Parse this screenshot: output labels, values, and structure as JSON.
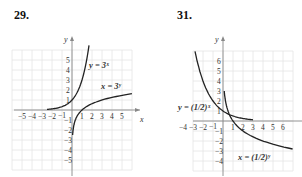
{
  "problems": [
    {
      "number": "29.",
      "x_axis_label": "x",
      "y_axis_label": "y",
      "x_ticks": [
        "-5",
        "-4",
        "-3",
        "-2",
        "-1",
        "1",
        "2",
        "3",
        "4",
        "5"
      ],
      "y_ticks": [
        "5",
        "4",
        "3",
        "2",
        "1",
        "-1",
        "-2",
        "-3",
        "-4",
        "-5"
      ],
      "curve_labels": [
        "y = 3ˣ",
        "x = 3ʸ"
      ]
    },
    {
      "number": "31.",
      "x_axis_label": "x",
      "y_axis_label": "y",
      "x_ticks": [
        "-4",
        "-3",
        "-2",
        "-1",
        "1",
        "2",
        "3",
        "4",
        "5",
        "6"
      ],
      "y_ticks": [
        "6",
        "5",
        "4",
        "3",
        "2",
        "1",
        "-1",
        "-2",
        "-3",
        "-4"
      ],
      "curve_labels": [
        "y = (1/2)ˣ",
        "x = (1/2)ʸ"
      ]
    }
  ],
  "chart_data": [
    {
      "type": "line",
      "title": "29.",
      "xlabel": "x",
      "ylabel": "y",
      "xlim": [
        -5.8,
        6
      ],
      "ylim": [
        -5.8,
        6
      ],
      "grid": true,
      "series": [
        {
          "name": "y = 3^x",
          "x": [
            -2.5,
            -2,
            -1.5,
            -1,
            -0.5,
            0,
            0.5,
            1,
            1.5,
            1.7
          ],
          "y": [
            0.06,
            0.11,
            0.19,
            0.33,
            0.58,
            1,
            1.73,
            3,
            5.2,
            6.47
          ]
        },
        {
          "name": "x = 3^y",
          "x": [
            0.06,
            0.11,
            0.19,
            0.33,
            0.58,
            1,
            1.73,
            3,
            5.2,
            6
          ],
          "y": [
            -2.5,
            -2,
            -1.5,
            -1,
            -0.5,
            0,
            0.5,
            1,
            1.5,
            1.63
          ]
        }
      ]
    },
    {
      "type": "line",
      "title": "31.",
      "xlabel": "x",
      "ylabel": "y",
      "xlim": [
        -4.8,
        7.2
      ],
      "ylim": [
        -4.8,
        7
      ],
      "grid": true,
      "series": [
        {
          "name": "y = (1/2)^x",
          "x": [
            -2.8,
            -2.5,
            -2,
            -1.5,
            -1,
            -0.5,
            0,
            0.5,
            1,
            1.5,
            2,
            2.5,
            3
          ],
          "y": [
            6.96,
            5.66,
            4,
            2.83,
            2,
            1.41,
            1,
            0.71,
            0.5,
            0.35,
            0.25,
            0.18,
            0.13
          ]
        },
        {
          "name": "x = (1/2)^y",
          "x": [
            0.13,
            0.18,
            0.25,
            0.35,
            0.5,
            0.71,
            1,
            1.41,
            2,
            2.83,
            4,
            5.66,
            6.96
          ],
          "y": [
            3,
            2.5,
            2,
            1.5,
            1,
            0.5,
            0,
            -0.5,
            -1,
            -1.5,
            -2,
            -2.5,
            -2.8
          ]
        }
      ]
    }
  ]
}
